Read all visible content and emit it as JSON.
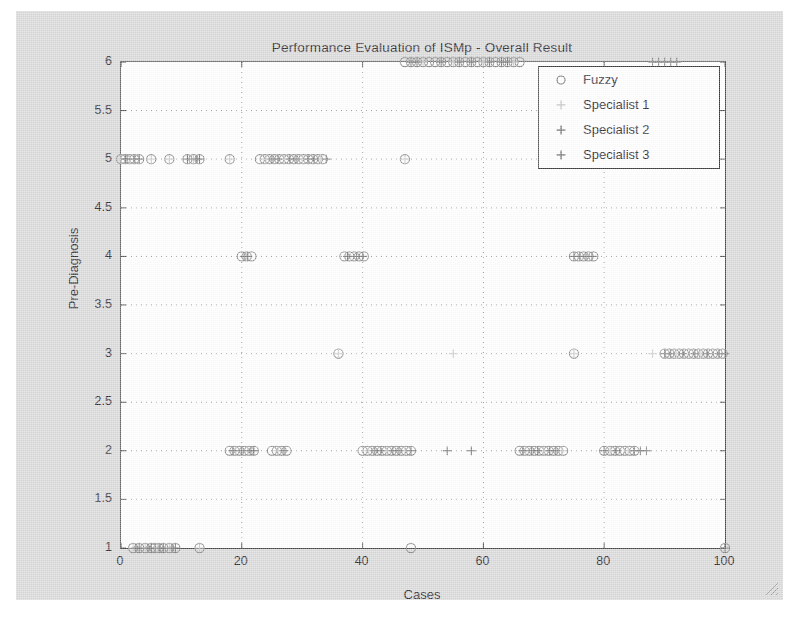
{
  "figure": {
    "background_color": "#d9d9d9",
    "axes_background": "#ffffff",
    "axes_border_color": "#4a4a4a"
  },
  "chart_data": {
    "type": "scatter",
    "title": "Performance Evaluation of ISMp - Overall Result",
    "xlabel": "Cases",
    "ylabel": "Pre-Diagnosis",
    "xlim": [
      0,
      100
    ],
    "ylim": [
      1,
      6
    ],
    "xticks": [
      0,
      20,
      40,
      60,
      80,
      100
    ],
    "xtick_labels": [
      "0",
      "20",
      "40",
      "60",
      "80",
      "100"
    ],
    "yticks": [
      1,
      1.5,
      2,
      2.5,
      3,
      3.5,
      4,
      4.5,
      5,
      5.5,
      6
    ],
    "ytick_labels": [
      "1",
      "1.5",
      "2",
      "2.5",
      "3",
      "3.5",
      "4",
      "4.5",
      "5",
      "5.5",
      "6"
    ],
    "grid": true,
    "grid_style": "dotted",
    "legend_position": "top-right",
    "series": [
      {
        "name": "Fuzzy",
        "marker": "circle",
        "color": "#8a8a8a",
        "points": [
          [
            2,
            1
          ],
          [
            3,
            1
          ],
          [
            4,
            1
          ],
          [
            5,
            1
          ],
          [
            5.6,
            1
          ],
          [
            6.2,
            1
          ],
          [
            7,
            1
          ],
          [
            8,
            1
          ],
          [
            9,
            1
          ],
          [
            13,
            1
          ],
          [
            48,
            1
          ],
          [
            100,
            1
          ],
          [
            0,
            5
          ],
          [
            0.7,
            5
          ],
          [
            1.4,
            5
          ],
          [
            2.2,
            5
          ],
          [
            3,
            5
          ],
          [
            5,
            5
          ],
          [
            8,
            5
          ],
          [
            11,
            5
          ],
          [
            12,
            5
          ],
          [
            13,
            5
          ],
          [
            18,
            5
          ],
          [
            23,
            5
          ],
          [
            23.8,
            5
          ],
          [
            24.6,
            5
          ],
          [
            25.4,
            5
          ],
          [
            26.2,
            5
          ],
          [
            27,
            5
          ],
          [
            27.8,
            5
          ],
          [
            28.6,
            5
          ],
          [
            29.4,
            5
          ],
          [
            30.2,
            5
          ],
          [
            31,
            5
          ],
          [
            31.8,
            5
          ],
          [
            32.6,
            5
          ],
          [
            33.4,
            5
          ],
          [
            47,
            5
          ],
          [
            20,
            4
          ],
          [
            20.8,
            4
          ],
          [
            21.6,
            4
          ],
          [
            37,
            4
          ],
          [
            37.8,
            4
          ],
          [
            38.6,
            4
          ],
          [
            39.4,
            4
          ],
          [
            40.2,
            4
          ],
          [
            75,
            4
          ],
          [
            75.8,
            4
          ],
          [
            76.6,
            4
          ],
          [
            77.4,
            4
          ],
          [
            78.2,
            4
          ],
          [
            36,
            3
          ],
          [
            75,
            3
          ],
          [
            90,
            3
          ],
          [
            90.8,
            3
          ],
          [
            91.6,
            3
          ],
          [
            92.4,
            3
          ],
          [
            93.2,
            3
          ],
          [
            94,
            3
          ],
          [
            94.8,
            3
          ],
          [
            95.6,
            3
          ],
          [
            96.4,
            3
          ],
          [
            97.2,
            3
          ],
          [
            98,
            3
          ],
          [
            98.8,
            3
          ],
          [
            99.6,
            3
          ],
          [
            18,
            2
          ],
          [
            18.8,
            2
          ],
          [
            19.6,
            2
          ],
          [
            20.4,
            2
          ],
          [
            21.2,
            2
          ],
          [
            22,
            2
          ],
          [
            25,
            2
          ],
          [
            25.8,
            2
          ],
          [
            26.6,
            2
          ],
          [
            27.4,
            2
          ],
          [
            40,
            2
          ],
          [
            40.8,
            2
          ],
          [
            41.6,
            2
          ],
          [
            42.4,
            2
          ],
          [
            43.2,
            2
          ],
          [
            44,
            2
          ],
          [
            44.8,
            2
          ],
          [
            45.6,
            2
          ],
          [
            46.4,
            2
          ],
          [
            47.2,
            2
          ],
          [
            48,
            2
          ],
          [
            66,
            2
          ],
          [
            66.8,
            2
          ],
          [
            67.6,
            2
          ],
          [
            68.4,
            2
          ],
          [
            69.2,
            2
          ],
          [
            70,
            2
          ],
          [
            70.8,
            2
          ],
          [
            71.6,
            2
          ],
          [
            72.4,
            2
          ],
          [
            73.2,
            2
          ],
          [
            80,
            2
          ],
          [
            81,
            2
          ],
          [
            81.8,
            2
          ],
          [
            82.6,
            2
          ],
          [
            83.4,
            2
          ],
          [
            84.2,
            2
          ],
          [
            85,
            2
          ],
          [
            47,
            6
          ],
          [
            48,
            6
          ],
          [
            49,
            6
          ],
          [
            50,
            6
          ],
          [
            51,
            6
          ],
          [
            52,
            6
          ],
          [
            53,
            6
          ],
          [
            54,
            6
          ],
          [
            55,
            6
          ],
          [
            56,
            6
          ],
          [
            57,
            6
          ],
          [
            58,
            6
          ],
          [
            59,
            6
          ],
          [
            60,
            6
          ],
          [
            61,
            6
          ],
          [
            62,
            6
          ],
          [
            63,
            6
          ],
          [
            64,
            6
          ],
          [
            65,
            6
          ],
          [
            66,
            6
          ]
        ]
      },
      {
        "name": "Specialist 1",
        "marker": "plus",
        "color": "#c9c9c9",
        "points": [
          [
            2,
            1
          ],
          [
            4,
            1
          ],
          [
            6,
            1
          ],
          [
            8,
            1
          ],
          [
            13,
            1
          ],
          [
            0,
            5
          ],
          [
            1.4,
            5
          ],
          [
            3,
            5
          ],
          [
            5,
            5
          ],
          [
            8,
            5
          ],
          [
            12,
            5
          ],
          [
            18,
            5
          ],
          [
            24,
            5
          ],
          [
            27,
            5
          ],
          [
            30,
            5
          ],
          [
            33,
            5
          ],
          [
            47,
            5
          ],
          [
            20.8,
            4
          ],
          [
            38,
            4
          ],
          [
            40,
            4
          ],
          [
            76,
            4
          ],
          [
            78,
            4
          ],
          [
            36,
            3
          ],
          [
            55,
            3
          ],
          [
            75,
            3
          ],
          [
            88,
            3
          ],
          [
            92,
            3
          ],
          [
            96,
            3
          ],
          [
            99,
            3
          ],
          [
            19,
            2
          ],
          [
            21,
            2
          ],
          [
            26,
            2
          ],
          [
            41,
            2
          ],
          [
            44,
            2
          ],
          [
            47,
            2
          ],
          [
            67,
            2
          ],
          [
            70,
            2
          ],
          [
            73,
            2
          ],
          [
            81,
            2
          ],
          [
            84,
            2
          ],
          [
            50,
            6
          ],
          [
            55,
            6
          ],
          [
            60,
            6
          ],
          [
            65,
            6
          ]
        ]
      },
      {
        "name": "Specialist 2",
        "marker": "plus",
        "color": "#7a7a7a",
        "points": [
          [
            3,
            1
          ],
          [
            5,
            1
          ],
          [
            7,
            1
          ],
          [
            9,
            1
          ],
          [
            0.7,
            5
          ],
          [
            2.2,
            5
          ],
          [
            11,
            5
          ],
          [
            13,
            5
          ],
          [
            25,
            5
          ],
          [
            28,
            5
          ],
          [
            31,
            5
          ],
          [
            34,
            5
          ],
          [
            21,
            4
          ],
          [
            39,
            4
          ],
          [
            75,
            4
          ],
          [
            77,
            4
          ],
          [
            90,
            3
          ],
          [
            93,
            3
          ],
          [
            97,
            3
          ],
          [
            100,
            3
          ],
          [
            20,
            2
          ],
          [
            22,
            2
          ],
          [
            27,
            2
          ],
          [
            42,
            2
          ],
          [
            45,
            2
          ],
          [
            48,
            2
          ],
          [
            54,
            2
          ],
          [
            58,
            2
          ],
          [
            68,
            2
          ],
          [
            71,
            2
          ],
          [
            80,
            2
          ],
          [
            85,
            2
          ],
          [
            86,
            2
          ],
          [
            48,
            6
          ],
          [
            53,
            6
          ],
          [
            58,
            6
          ],
          [
            63,
            6
          ],
          [
            88,
            6
          ],
          [
            90,
            6
          ],
          [
            92,
            6
          ]
        ]
      },
      {
        "name": "Specialist 3",
        "marker": "plus",
        "color": "#7a7a7a",
        "points": [
          [
            2.5,
            1
          ],
          [
            4.5,
            1
          ],
          [
            6.5,
            1
          ],
          [
            8.5,
            1
          ],
          [
            100,
            1
          ],
          [
            1,
            5
          ],
          [
            3,
            5
          ],
          [
            12.5,
            5
          ],
          [
            26,
            5
          ],
          [
            29,
            5
          ],
          [
            32,
            5
          ],
          [
            20.4,
            4
          ],
          [
            37.5,
            4
          ],
          [
            40,
            4
          ],
          [
            76,
            4
          ],
          [
            78,
            4
          ],
          [
            91,
            3
          ],
          [
            95,
            3
          ],
          [
            99,
            3
          ],
          [
            18.5,
            2
          ],
          [
            21.5,
            2
          ],
          [
            43,
            2
          ],
          [
            46,
            2
          ],
          [
            66.5,
            2
          ],
          [
            69,
            2
          ],
          [
            72,
            2
          ],
          [
            82,
            2
          ],
          [
            87,
            2
          ],
          [
            49,
            6
          ],
          [
            56,
            6
          ],
          [
            61,
            6
          ],
          [
            64,
            6
          ],
          [
            89,
            6
          ],
          [
            91,
            6
          ]
        ]
      }
    ]
  },
  "legend": {
    "entries": [
      {
        "label": "Fuzzy",
        "marker": "circle",
        "color": "#6e6e6e"
      },
      {
        "label": "Specialist 1",
        "marker": "plus",
        "color": "#c4c4c4"
      },
      {
        "label": "Specialist 2",
        "marker": "plus",
        "color": "#6e6e6e"
      },
      {
        "label": "Specialist 3",
        "marker": "plus",
        "color": "#6e6e6e"
      }
    ]
  }
}
